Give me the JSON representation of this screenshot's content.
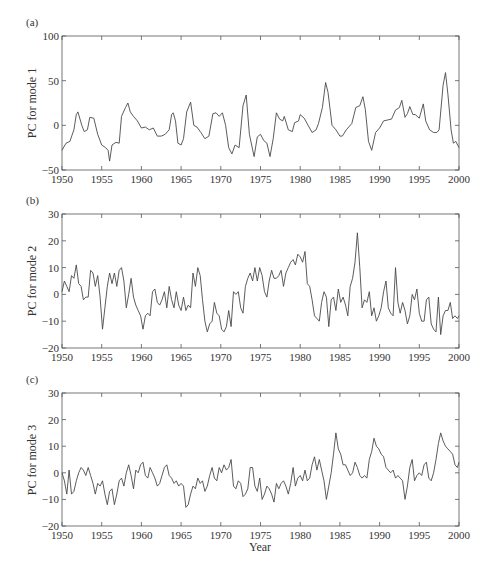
{
  "figure": {
    "xlabel": "Year",
    "line_color": "#4a4a4a",
    "axis_color": "#555555"
  },
  "chart_data": [
    {
      "type": "line",
      "panel_label": "(a)",
      "title": "",
      "xlabel": "",
      "ylabel": "PC for mode 1",
      "xlim": [
        1950,
        2000
      ],
      "ylim": [
        -50,
        100
      ],
      "xticks": [
        1950,
        1955,
        1960,
        1965,
        1970,
        1975,
        1980,
        1985,
        1990,
        1995,
        2000
      ],
      "yticks": [
        -50,
        0,
        50,
        100
      ],
      "grid": false,
      "legend": null,
      "series": [
        {
          "name": "PC1",
          "x": [
            1950,
            1950.5,
            1951,
            1951.5,
            1951.8,
            1952,
            1952.5,
            1952.8,
            1953.2,
            1953.5,
            1954,
            1954.5,
            1955,
            1955.5,
            1955.8,
            1956,
            1956.3,
            1956.8,
            1957.2,
            1957.5,
            1958,
            1958.3,
            1958.6,
            1959,
            1959.5,
            1960,
            1960.5,
            1961,
            1961.5,
            1962,
            1962.5,
            1963,
            1963.5,
            1963.8,
            1964,
            1964.3,
            1964.6,
            1965,
            1965.3,
            1965.7,
            1966.2,
            1966.6,
            1967,
            1967.5,
            1968,
            1968.5,
            1969,
            1969.4,
            1969.8,
            1970.2,
            1970.6,
            1971,
            1971.4,
            1971.8,
            1972.3,
            1972.8,
            1973.2,
            1973.6,
            1974.2,
            1974.6,
            1975,
            1975.4,
            1975.8,
            1976.2,
            1976.6,
            1977,
            1977.4,
            1977.8,
            1978,
            1978.5,
            1979,
            1979.3,
            1979.8,
            1980,
            1980.5,
            1981,
            1981.5,
            1982,
            1982.3,
            1982.8,
            1983.2,
            1983.5,
            1983.8,
            1984,
            1984.5,
            1985,
            1985.3,
            1985.8,
            1986.5,
            1987,
            1987.5,
            1987.9,
            1988.2,
            1988.6,
            1989,
            1989.5,
            1990,
            1990.5,
            1991,
            1991.5,
            1992,
            1992.5,
            1992.8,
            1993.2,
            1993.5,
            1993.8,
            1994.2,
            1994.5,
            1995,
            1995.5,
            1995.8,
            1996.3,
            1996.8,
            1997.2,
            1997.5,
            1998,
            1998.3,
            1998.6,
            1999,
            1999.3,
            1999.6,
            2000
          ],
          "values": [
            -28,
            -20,
            -18,
            -5,
            12,
            15,
            0,
            -7,
            -5,
            9,
            8,
            -10,
            -22,
            -25,
            -28,
            -40,
            -22,
            -19,
            -20,
            10,
            20,
            25,
            15,
            10,
            5,
            -3,
            -2,
            -5,
            -3,
            -12,
            -12,
            -10,
            -5,
            12,
            14,
            5,
            -20,
            -22,
            -15,
            15,
            26,
            0,
            -2,
            -8,
            -15,
            -12,
            13,
            14,
            10,
            14,
            0,
            -25,
            -32,
            -22,
            -25,
            22,
            34,
            -10,
            -35,
            -13,
            -10,
            -17,
            -20,
            -35,
            -15,
            14,
            7,
            5,
            10,
            -5,
            -7,
            3,
            5,
            12,
            8,
            0,
            -8,
            -5,
            2,
            20,
            48,
            37,
            15,
            0,
            -5,
            -12,
            -12,
            -5,
            2,
            20,
            22,
            32,
            18,
            -18,
            -28,
            -8,
            -3,
            5,
            6,
            7,
            17,
            20,
            28,
            9,
            13,
            21,
            12,
            12,
            8,
            24,
            5,
            -5,
            -8,
            -8,
            -5,
            45,
            59,
            35,
            -5,
            -20,
            -18,
            -25
          ]
        }
      ]
    },
    {
      "type": "line",
      "panel_label": "(b)",
      "title": "",
      "xlabel": "",
      "ylabel": "PC for mode 2",
      "xlim": [
        1950,
        2000
      ],
      "ylim": [
        -20,
        30
      ],
      "xticks": [
        1950,
        1955,
        1960,
        1965,
        1970,
        1975,
        1980,
        1985,
        1990,
        1995,
        2000
      ],
      "yticks": [
        -20,
        -10,
        0,
        10,
        20,
        30
      ],
      "grid": false,
      "legend": null,
      "series": [
        {
          "name": "PC2",
          "x": [
            1950,
            1950.3,
            1950.6,
            1950.9,
            1951.2,
            1951.5,
            1951.8,
            1952.1,
            1952.4,
            1952.7,
            1953,
            1953.3,
            1953.6,
            1953.9,
            1954.2,
            1954.5,
            1954.8,
            1955.1,
            1955.4,
            1955.7,
            1956,
            1956.3,
            1956.6,
            1956.9,
            1957.2,
            1957.5,
            1957.8,
            1958.1,
            1958.4,
            1958.7,
            1959,
            1959.3,
            1959.6,
            1959.9,
            1960.2,
            1960.5,
            1960.8,
            1961.1,
            1961.4,
            1961.7,
            1962,
            1962.3,
            1962.6,
            1962.9,
            1963.2,
            1963.5,
            1963.8,
            1964.1,
            1964.4,
            1964.7,
            1965,
            1965.3,
            1965.6,
            1965.9,
            1966.2,
            1966.5,
            1966.8,
            1967.1,
            1967.4,
            1967.7,
            1968,
            1968.3,
            1968.6,
            1968.9,
            1969.2,
            1969.5,
            1969.8,
            1970.1,
            1970.4,
            1970.7,
            1971,
            1971.3,
            1971.6,
            1971.9,
            1972.2,
            1972.5,
            1972.8,
            1973.1,
            1973.4,
            1973.7,
            1974,
            1974.3,
            1974.6,
            1974.9,
            1975.2,
            1975.5,
            1975.8,
            1976.1,
            1976.4,
            1976.7,
            1977,
            1977.3,
            1977.6,
            1977.9,
            1978.2,
            1978.5,
            1978.8,
            1979.1,
            1979.4,
            1979.7,
            1980,
            1980.3,
            1980.6,
            1980.9,
            1981.2,
            1981.5,
            1981.8,
            1982.1,
            1982.4,
            1982.7,
            1983,
            1983.3,
            1983.6,
            1983.9,
            1984.2,
            1984.5,
            1984.8,
            1985.1,
            1985.4,
            1985.7,
            1986,
            1986.3,
            1986.6,
            1986.9,
            1987.2,
            1987.5,
            1987.8,
            1988.1,
            1988.4,
            1988.7,
            1989,
            1989.3,
            1989.6,
            1989.9,
            1990.2,
            1990.5,
            1990.8,
            1991.1,
            1991.4,
            1991.7,
            1992,
            1992.3,
            1992.6,
            1992.9,
            1993.2,
            1993.5,
            1993.8,
            1994.1,
            1994.4,
            1994.7,
            1995,
            1995.3,
            1995.6,
            1995.9,
            1996.2,
            1996.5,
            1996.8,
            1997.1,
            1997.4,
            1997.7,
            1998,
            1998.3,
            1998.6,
            1998.9,
            1999.2,
            1999.5,
            1999.8,
            2000
          ],
          "values": [
            1,
            5,
            3,
            1,
            7,
            6,
            11,
            4,
            3,
            -2,
            -1,
            -1,
            9,
            8,
            3,
            7,
            -1,
            -13,
            -5,
            3,
            8,
            4,
            8,
            3,
            9,
            10,
            5,
            -5,
            0,
            6,
            -1,
            -4,
            -6,
            -8,
            -13,
            -8,
            -7,
            -8,
            1,
            2,
            -3,
            -4,
            -2,
            1,
            -5,
            3,
            -2,
            -5,
            1,
            -4,
            -6,
            -1,
            -6,
            -4,
            -5,
            8,
            3,
            10,
            7,
            -2,
            -10,
            -14,
            -11,
            -10,
            -3,
            -7,
            -8,
            -13,
            -14,
            -12,
            -6,
            -12,
            1,
            0,
            1,
            -5,
            -7,
            3,
            6,
            8,
            5,
            10,
            5,
            10,
            7,
            1,
            -1,
            5,
            9,
            6,
            6,
            7,
            9,
            3,
            8,
            10,
            12,
            13,
            11,
            15,
            14,
            12,
            16,
            4,
            3,
            -2,
            -8,
            -9,
            -10,
            -3,
            1,
            -1,
            -12,
            -2,
            -1,
            -6,
            2,
            -3,
            -1,
            -4,
            -8,
            3,
            6,
            12,
            23,
            10,
            -5,
            -2,
            -3,
            1,
            -8,
            -5,
            -10,
            -8,
            -5,
            1,
            5,
            -5,
            -7,
            -8,
            10,
            -3,
            -7,
            -3,
            -6,
            -11,
            -8,
            0,
            -2,
            2,
            -7,
            -10,
            -10,
            -2,
            -1,
            -11,
            -13,
            -14,
            -1,
            -15,
            -8,
            -6,
            -6,
            -3,
            -9,
            -8,
            -9,
            -8,
            -7,
            10,
            18,
            16,
            22,
            12,
            15,
            8,
            5,
            3
          ]
        }
      ]
    },
    {
      "type": "line",
      "panel_label": "(c)",
      "title": "",
      "xlabel": "Year",
      "ylabel": "PC for mode 3",
      "xlim": [
        1950,
        2000
      ],
      "ylim": [
        -20,
        30
      ],
      "xticks": [
        1950,
        1955,
        1960,
        1965,
        1970,
        1975,
        1980,
        1985,
        1990,
        1995,
        2000
      ],
      "yticks": [
        -20,
        -10,
        0,
        10,
        20,
        30
      ],
      "grid": false,
      "legend": null,
      "series": [
        {
          "name": "PC3",
          "x": [
            1950,
            1950.3,
            1950.6,
            1950.9,
            1951.2,
            1951.5,
            1951.8,
            1952.1,
            1952.4,
            1952.7,
            1953,
            1953.3,
            1953.6,
            1953.9,
            1954.2,
            1954.5,
            1954.8,
            1955.1,
            1955.4,
            1955.7,
            1956,
            1956.3,
            1956.6,
            1956.9,
            1957.2,
            1957.5,
            1957.8,
            1958.1,
            1958.4,
            1958.7,
            1959,
            1959.3,
            1959.6,
            1959.9,
            1960.2,
            1960.5,
            1960.8,
            1961.1,
            1961.4,
            1961.7,
            1962,
            1962.3,
            1962.6,
            1962.9,
            1963.2,
            1963.5,
            1963.8,
            1964.1,
            1964.4,
            1964.7,
            1965,
            1965.3,
            1965.6,
            1965.9,
            1966.2,
            1966.5,
            1966.8,
            1967.1,
            1967.4,
            1967.7,
            1968,
            1968.3,
            1968.6,
            1968.9,
            1969.2,
            1969.5,
            1969.8,
            1970.1,
            1970.4,
            1970.7,
            1971,
            1971.3,
            1971.6,
            1971.9,
            1972.2,
            1972.5,
            1972.8,
            1973.1,
            1973.4,
            1973.7,
            1974,
            1974.3,
            1974.6,
            1974.9,
            1975.2,
            1975.5,
            1975.8,
            1976.1,
            1976.4,
            1976.7,
            1977,
            1977.3,
            1977.6,
            1977.9,
            1978.2,
            1978.5,
            1978.8,
            1979.1,
            1979.4,
            1979.7,
            1980,
            1980.3,
            1980.6,
            1980.9,
            1981.2,
            1981.5,
            1981.8,
            1982.1,
            1982.4,
            1982.7,
            1983,
            1983.3,
            1983.6,
            1983.9,
            1984.2,
            1984.5,
            1984.8,
            1985.1,
            1985.4,
            1985.7,
            1986,
            1986.3,
            1986.6,
            1986.9,
            1987.2,
            1987.5,
            1987.8,
            1988.1,
            1988.4,
            1988.7,
            1989,
            1989.3,
            1989.6,
            1989.9,
            1990.2,
            1990.5,
            1990.8,
            1991.1,
            1991.4,
            1991.7,
            1992,
            1992.3,
            1992.6,
            1992.9,
            1993.2,
            1993.5,
            1993.8,
            1994.1,
            1994.4,
            1994.7,
            1995,
            1995.3,
            1995.6,
            1995.9,
            1996.2,
            1996.5,
            1996.8,
            1997.1,
            1997.4,
            1997.7,
            1998,
            1998.3,
            1998.6,
            1998.9,
            1999.2,
            1999.5,
            1999.8,
            2000
          ],
          "values": [
            0,
            -3,
            -8,
            1,
            -8,
            -7,
            -3,
            0,
            2,
            1,
            -1,
            2,
            -1,
            -4,
            -8,
            -4,
            -5,
            -3,
            -8,
            -12,
            -7,
            -6,
            -12,
            -8,
            -3,
            -2,
            -5,
            0,
            3,
            -1,
            -6,
            1,
            0,
            3,
            4,
            -1,
            -2,
            2,
            0,
            -2,
            -5,
            -4,
            -1,
            2,
            3,
            -1,
            -2,
            -4,
            -3,
            -5,
            -4,
            -5,
            -13,
            -12,
            -8,
            -5,
            -6,
            -2,
            -4,
            -3,
            -7,
            -5,
            -1,
            2,
            -2,
            -3,
            2,
            0,
            3,
            1,
            2,
            5,
            -5,
            -6,
            -3,
            -4,
            -9,
            -8,
            -6,
            2,
            2,
            -5,
            -7,
            -2,
            -10,
            -8,
            -5,
            -6,
            -8,
            -11,
            -4,
            -6,
            -4,
            -3,
            -5,
            -8,
            -4,
            2,
            -5,
            -2,
            -1,
            -3,
            1,
            -3,
            -2,
            3,
            6,
            1,
            5,
            1,
            -3,
            -10,
            -5,
            0,
            7,
            15,
            9,
            7,
            3,
            3,
            1,
            -1,
            0,
            4,
            2,
            -1,
            -2,
            -1,
            -2,
            5,
            8,
            13,
            10,
            9,
            7,
            6,
            2,
            1,
            0,
            1,
            -2,
            -1,
            -2,
            -3,
            -10,
            -5,
            2,
            5,
            -3,
            -1,
            0,
            -1,
            3,
            4,
            -2,
            -3,
            0,
            5,
            11,
            15,
            12,
            10,
            9,
            8,
            7,
            3,
            2,
            4,
            14,
            28,
            27,
            16,
            7,
            6,
            10
          ]
        }
      ]
    }
  ]
}
